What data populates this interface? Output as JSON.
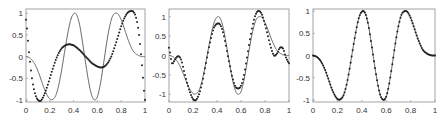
{
  "chart_data": [
    {
      "type": "line",
      "title": "",
      "xlabel": "",
      "ylabel": "",
      "xlim": [
        0,
        1
      ],
      "ylim": [
        -1.05,
        1.1
      ],
      "xticks": [
        "0",
        "0.2",
        "0.4",
        "0.6",
        "0.8",
        "1"
      ],
      "yticks": [
        "1",
        "0.5",
        "0",
        "-0.5",
        "-1"
      ],
      "grid": false,
      "legend": null,
      "series": [
        {
          "name": "reference (solid line)",
          "style": "line",
          "x": [
            0,
            0.025,
            0.05,
            0.075,
            0.1,
            0.125,
            0.15,
            0.175,
            0.2,
            0.225,
            0.25,
            0.275,
            0.3,
            0.325,
            0.35,
            0.375,
            0.4,
            0.425,
            0.45,
            0.475,
            0.5,
            0.525,
            0.55,
            0.575,
            0.6,
            0.625,
            0.65,
            0.675,
            0.7,
            0.725,
            0.75,
            0.775,
            0.8,
            0.825,
            0.85,
            0.875,
            0.9,
            0.925,
            0.95,
            0.975,
            1
          ],
          "values": [
            0,
            -0.02,
            -0.08,
            -0.18,
            -0.33,
            -0.52,
            -0.72,
            -0.88,
            -0.98,
            -0.99,
            -0.9,
            -0.66,
            -0.3,
            0.12,
            0.52,
            0.84,
            0.99,
            0.97,
            0.74,
            0.33,
            -0.13,
            -0.56,
            -0.88,
            -1.0,
            -0.93,
            -0.63,
            -0.2,
            0.27,
            0.66,
            0.92,
            1.0,
            0.98,
            0.85,
            0.66,
            0.45,
            0.27,
            0.13,
            0.06,
            0.02,
            0.0,
            0.0
          ]
        },
        {
          "name": "approximation (dots)",
          "style": "dots",
          "x": [
            0,
            0.025,
            0.05,
            0.075,
            0.1,
            0.125,
            0.15,
            0.175,
            0.2,
            0.225,
            0.25,
            0.275,
            0.3,
            0.325,
            0.35,
            0.375,
            0.4,
            0.425,
            0.45,
            0.475,
            0.5,
            0.525,
            0.55,
            0.575,
            0.6,
            0.625,
            0.65,
            0.675,
            0.7,
            0.725,
            0.75,
            0.775,
            0.8,
            0.825,
            0.85,
            0.875,
            0.9,
            0.925,
            0.95,
            0.975,
            1
          ],
          "values": [
            0.85,
            0.1,
            -0.5,
            -0.85,
            -1.0,
            -1.02,
            -0.9,
            -0.72,
            -0.5,
            -0.28,
            -0.08,
            0.08,
            0.19,
            0.25,
            0.28,
            0.28,
            0.26,
            0.21,
            0.15,
            0.08,
            0.0,
            -0.07,
            -0.14,
            -0.19,
            -0.23,
            -0.25,
            -0.24,
            -0.19,
            -0.09,
            0.06,
            0.26,
            0.48,
            0.7,
            0.88,
            1.0,
            1.05,
            1.04,
            0.9,
            0.5,
            -0.2,
            -1.0
          ]
        }
      ]
    },
    {
      "type": "line",
      "title": "",
      "xlabel": "",
      "ylabel": "",
      "xlim": [
        0,
        1
      ],
      "ylim": [
        -1.2,
        1.2
      ],
      "xticks": [
        "0",
        "0.2",
        "0.4",
        "0.6",
        "0.8",
        "1"
      ],
      "yticks": [
        "1",
        "0.5",
        "0",
        "-0.5",
        "-1"
      ],
      "grid": false,
      "legend": null,
      "series": [
        {
          "name": "reference (solid line)",
          "style": "line",
          "x": [
            0,
            0.025,
            0.05,
            0.075,
            0.1,
            0.125,
            0.15,
            0.175,
            0.2,
            0.225,
            0.25,
            0.275,
            0.3,
            0.325,
            0.35,
            0.375,
            0.4,
            0.425,
            0.45,
            0.475,
            0.5,
            0.525,
            0.55,
            0.575,
            0.6,
            0.625,
            0.65,
            0.675,
            0.7,
            0.725,
            0.75,
            0.775,
            0.8,
            0.825,
            0.85,
            0.875,
            0.9,
            0.925,
            0.95,
            0.975,
            1
          ],
          "values": [
            0,
            -0.02,
            -0.08,
            -0.18,
            -0.33,
            -0.52,
            -0.72,
            -0.88,
            -0.98,
            -0.99,
            -0.9,
            -0.66,
            -0.3,
            0.12,
            0.52,
            0.84,
            0.99,
            0.97,
            0.74,
            0.33,
            -0.13,
            -0.56,
            -0.88,
            -1.0,
            -0.93,
            -0.63,
            -0.2,
            0.27,
            0.66,
            0.92,
            1.0,
            0.98,
            0.85,
            0.66,
            0.45,
            0.27,
            0.13,
            0.06,
            0.02,
            0.0,
            0.0
          ]
        },
        {
          "name": "approximation (dots)",
          "style": "dots",
          "x": [
            0,
            0.025,
            0.05,
            0.075,
            0.1,
            0.125,
            0.15,
            0.175,
            0.2,
            0.225,
            0.25,
            0.275,
            0.3,
            0.325,
            0.35,
            0.375,
            0.4,
            0.425,
            0.45,
            0.475,
            0.5,
            0.525,
            0.55,
            0.575,
            0.6,
            0.625,
            0.65,
            0.675,
            0.7,
            0.725,
            0.75,
            0.775,
            0.8,
            0.825,
            0.85,
            0.875,
            0.9,
            0.925,
            0.95,
            0.975,
            1
          ],
          "values": [
            0.2,
            -0.2,
            -0.1,
            -0.02,
            -0.1,
            -0.4,
            -0.7,
            -0.95,
            -1.12,
            -1.15,
            -1.0,
            -0.72,
            -0.33,
            0.08,
            0.45,
            0.72,
            0.82,
            0.8,
            0.6,
            0.25,
            -0.15,
            -0.52,
            -0.78,
            -0.85,
            -0.78,
            -0.5,
            -0.05,
            0.42,
            0.82,
            1.08,
            1.15,
            1.05,
            0.8,
            0.5,
            0.2,
            0.0,
            0.05,
            0.2,
            0.18,
            -0.05,
            -0.2
          ]
        }
      ]
    },
    {
      "type": "line",
      "title": "",
      "xlabel": "",
      "ylabel": "",
      "xlim": [
        0,
        1
      ],
      "ylim": [
        -1.05,
        1.05
      ],
      "xticks": [
        "0",
        "0.2",
        "0.4",
        "0.6",
        "0.8",
        "1"
      ],
      "yticks": [
        "1",
        "0.5",
        "0",
        "-0.5",
        "-1"
      ],
      "grid": false,
      "legend": null,
      "series": [
        {
          "name": "reference (solid line)",
          "style": "line",
          "x": [
            0,
            0.025,
            0.05,
            0.075,
            0.1,
            0.125,
            0.15,
            0.175,
            0.2,
            0.225,
            0.25,
            0.275,
            0.3,
            0.325,
            0.35,
            0.375,
            0.4,
            0.425,
            0.45,
            0.475,
            0.5,
            0.525,
            0.55,
            0.575,
            0.6,
            0.625,
            0.65,
            0.675,
            0.7,
            0.725,
            0.75,
            0.775,
            0.8,
            0.825,
            0.85,
            0.875,
            0.9,
            0.925,
            0.95,
            0.975,
            1
          ],
          "values": [
            0,
            -0.02,
            -0.08,
            -0.18,
            -0.33,
            -0.52,
            -0.72,
            -0.88,
            -0.98,
            -0.99,
            -0.9,
            -0.66,
            -0.3,
            0.12,
            0.52,
            0.84,
            0.99,
            0.97,
            0.74,
            0.33,
            -0.13,
            -0.56,
            -0.88,
            -1.0,
            -0.93,
            -0.63,
            -0.2,
            0.27,
            0.66,
            0.92,
            1.0,
            0.98,
            0.85,
            0.66,
            0.45,
            0.27,
            0.13,
            0.06,
            0.02,
            0.0,
            0.0
          ]
        },
        {
          "name": "approximation (dots)",
          "style": "dots",
          "x": [
            0,
            0.025,
            0.05,
            0.075,
            0.1,
            0.125,
            0.15,
            0.175,
            0.2,
            0.225,
            0.25,
            0.275,
            0.3,
            0.325,
            0.35,
            0.375,
            0.4,
            0.425,
            0.45,
            0.475,
            0.5,
            0.525,
            0.55,
            0.575,
            0.6,
            0.625,
            0.65,
            0.675,
            0.7,
            0.725,
            0.75,
            0.775,
            0.8,
            0.825,
            0.85,
            0.875,
            0.9,
            0.925,
            0.95,
            0.975,
            1
          ],
          "values": [
            0,
            -0.02,
            -0.08,
            -0.18,
            -0.33,
            -0.52,
            -0.72,
            -0.88,
            -0.98,
            -0.99,
            -0.9,
            -0.66,
            -0.3,
            0.12,
            0.52,
            0.84,
            0.99,
            0.97,
            0.74,
            0.33,
            -0.13,
            -0.56,
            -0.88,
            -1.0,
            -0.93,
            -0.63,
            -0.2,
            0.27,
            0.66,
            0.92,
            1.0,
            0.98,
            0.85,
            0.66,
            0.45,
            0.27,
            0.13,
            0.06,
            0.02,
            0.0,
            0.0
          ]
        }
      ]
    }
  ],
  "layout": {
    "panels": [
      {
        "box": [
          26,
          9,
          145,
          102
        ]
      },
      {
        "box": [
          169,
          9,
          289,
          102
        ]
      },
      {
        "box": [
          313,
          9,
          435,
          102
        ]
      }
    ]
  }
}
